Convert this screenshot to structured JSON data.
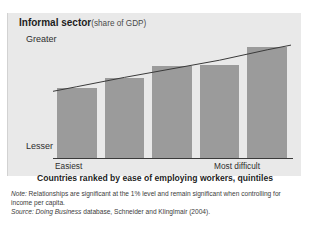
{
  "figure": {
    "top_clipped_text": "",
    "title_main": "Informal sector",
    "title_sub": "(share of GDP)",
    "axis_x_title": "Countries ranked by ease of employing workers, quintiles",
    "y_axis_top_label": "Greater",
    "y_axis_bottom_label": "Lesser",
    "x_tick_left": "Easiest",
    "x_tick_right": "Most difficult",
    "note_label": "Note:",
    "note_text": " Relationships are significant at the 1% level and remain significant when controlling for income per capita.",
    "source_label": "Source:",
    "source_italic": " Doing Business",
    "source_text": " database, Schneider and Klinglmair (2004).",
    "colors": {
      "panel_background": "#e9e9e9",
      "bar_fill": "#9b9b9b",
      "trend_line": "#3a3a3a",
      "axis_line": "#3a3a3a",
      "text": "#2b2b2b"
    }
  },
  "chart_data": {
    "type": "bar",
    "xlabel": "Countries ranked by ease of employing workers, quintiles",
    "ylabel": "",
    "categories": [
      "1",
      "2",
      "3",
      "4",
      "5"
    ],
    "category_labels": [
      "Easiest",
      "",
      "",
      "",
      "Most difficult"
    ],
    "values": [
      0.57,
      0.65,
      0.75,
      0.76,
      0.9
    ],
    "ylim": [
      0,
      1
    ],
    "ytick_labels": [
      "Lesser",
      "Greater"
    ],
    "grid": false,
    "legend": "none",
    "series": [
      {
        "name": "Informal sector (share of GDP)",
        "values": [
          0.57,
          0.65,
          0.75,
          0.76,
          0.9
        ]
      },
      {
        "name": "trend line",
        "type": "line",
        "values": [
          0.58,
          0.655,
          0.725,
          0.795,
          0.88
        ]
      }
    ],
    "annotations": [
      "Relationships are significant at the 1% level and remain significant when controlling for income per capita."
    ]
  }
}
